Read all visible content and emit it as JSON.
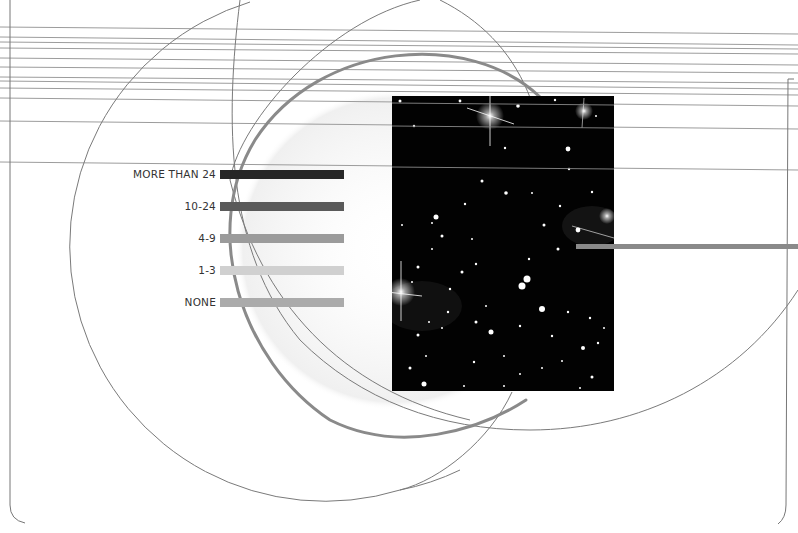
{
  "figure": {
    "type": "infographic-diagram",
    "legend": {
      "title": "",
      "items": [
        {
          "label": "MORE THAN 24",
          "color": "#262626"
        },
        {
          "label": "10-24",
          "color": "#5a5a5a"
        },
        {
          "label": "4-9",
          "color": "#9b9b9b"
        },
        {
          "label": "1-3",
          "color": "#d0d0d0"
        },
        {
          "label": "NONE",
          "color": "#ababab"
        }
      ]
    },
    "photo": {
      "subject": "star-field",
      "background_color": "#020202"
    },
    "colors": {
      "rule_lines": "#9a9a9a",
      "thin_arcs": "#7a7a7a",
      "thick_arc": "#8a8a8a",
      "pointer_bar": "#8a8a8a",
      "frame": "#666666"
    }
  }
}
